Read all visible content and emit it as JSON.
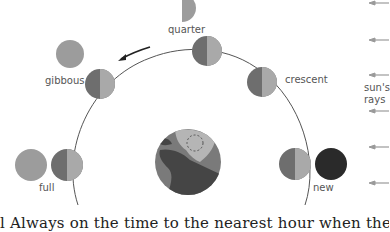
{
  "diagram": {
    "labels": {
      "quarter": "quarter",
      "gibbous": "gibbous",
      "crescent": "crescent",
      "full": "full",
      "new": "new",
      "sun_rays_line1": "sun's",
      "sun_rays_line2": "rays"
    },
    "caption": "l Always on the time to the nearest hour when the two bodies i",
    "colors": {
      "moon_dark": "#6e6e6e",
      "moon_light": "#a9a9a9",
      "phase_disk": "#9c9c9c",
      "new_moon": "#2a2a2a",
      "orbit_line": "#555555",
      "ray_arrow": "#9a9a9a",
      "earth_ocean": "#7a7a7a",
      "earth_land_dark": "#454545",
      "earth_land_light": "#b5b5b5"
    },
    "orbit_direction": "counter-clockwise",
    "phases": [
      {
        "name": "new",
        "moon_x": 295,
        "moon_y": 164,
        "view": "dark disk"
      },
      {
        "name": "crescent",
        "moon_x": 262,
        "moon_y": 82,
        "view": "thin crescent"
      },
      {
        "name": "quarter",
        "moon_x": 207,
        "moon_y": 51,
        "view": "half disk"
      },
      {
        "name": "gibbous",
        "moon_x": 100,
        "moon_y": 84,
        "view": "mostly lit disk"
      },
      {
        "name": "full",
        "moon_x": 67,
        "moon_y": 165,
        "view": "fully lit disk"
      }
    ],
    "sun_ray_count": 6
  }
}
